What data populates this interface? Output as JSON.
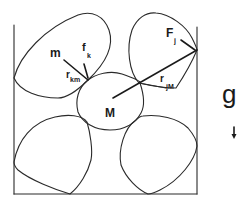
{
  "diagram": {
    "type": "granular-particles-in-container",
    "container": {
      "walls": [
        "left",
        "bottom",
        "right"
      ],
      "open_top": true
    },
    "particles": [
      {
        "id": "top-left",
        "label": "m"
      },
      {
        "id": "center",
        "label": "M"
      },
      {
        "id": "top-right",
        "label": ""
      },
      {
        "id": "bottom-left",
        "label": ""
      },
      {
        "id": "bottom-right",
        "label": ""
      }
    ],
    "labels": {
      "small_mass": "m",
      "large_mass": "M",
      "force_k_main": "f",
      "force_k_sub": "k",
      "r_km_main": "r",
      "r_km_sub": "km",
      "force_j_main": "F",
      "force_j_sub": "j",
      "r_jM_main": "r",
      "r_jM_sub": "jM",
      "gravity": "g"
    },
    "gravity_direction": "down",
    "colors": {
      "stroke": "#2a2a2a",
      "background": "#ffffff"
    }
  }
}
